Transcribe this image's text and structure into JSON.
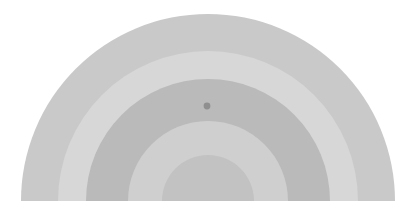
{
  "figure": {
    "title": "",
    "background_color": "#ffffff",
    "width": 417,
    "height": 217,
    "orientation": "semicircle-up",
    "center": {
      "x": 208,
      "y": 201
    },
    "outer_radius": 187
  },
  "chart_data": {
    "type": "pie",
    "title": "",
    "subtitle": "",
    "xlabel": "",
    "ylabel": "",
    "legend_position": "none",
    "grid": false,
    "shape": "semicircular-concentric-bands",
    "angular_extent_degrees": 180,
    "angular_start_degrees": 180,
    "center_x": 208,
    "center_y": 201,
    "radius_unit": "px",
    "categories": [
      "band-1-outer",
      "band-2",
      "band-3",
      "band-4",
      "band-5-inner"
    ],
    "values": [
      187,
      150,
      122,
      80,
      46
    ],
    "rings": [
      {
        "name": "band-1-outer",
        "inner_radius": 150,
        "outer_radius": 187,
        "color": "#c9c9c9"
      },
      {
        "name": "band-2",
        "inner_radius": 122,
        "outer_radius": 150,
        "color": "#d7d7d7"
      },
      {
        "name": "band-3",
        "inner_radius": 80,
        "outer_radius": 122,
        "color": "#bababa"
      },
      {
        "name": "band-4",
        "inner_radius": 46,
        "outer_radius": 80,
        "color": "#cfcfcf"
      },
      {
        "name": "band-5-inner",
        "inner_radius": 0,
        "outer_radius": 46,
        "color": "#c2c2c2"
      }
    ],
    "markers": [
      {
        "name": "marker-point",
        "x": 207,
        "y": 106,
        "radius": 3.4,
        "color": "#8f8f8f",
        "radial_distance": 95,
        "angle_degrees": 90.6,
        "in_band": "band-3"
      }
    ],
    "baseline": {
      "y": 201,
      "x_start": 21,
      "x_end": 395,
      "visible": false
    }
  }
}
